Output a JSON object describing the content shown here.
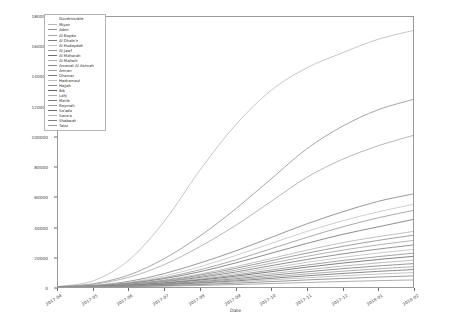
{
  "chart_data": {
    "type": "line",
    "title": "",
    "xlabel": "Date",
    "ylabel": "",
    "ylim": [
      0,
      180000
    ],
    "yticks": [
      0,
      20000,
      40000,
      60000,
      80000,
      100000,
      120000,
      140000,
      160000,
      180000
    ],
    "ytick_labels": [
      "0",
      "20000",
      "40000",
      "60000",
      "80000",
      "100000",
      "120000",
      "140000",
      "160000",
      "180000"
    ],
    "x": [
      "2017-04",
      "2017-05",
      "2017-06",
      "2017-07",
      "2017-08",
      "2017-09",
      "2017-10",
      "2017-11",
      "2017-12",
      "2018-01",
      "2018-02"
    ],
    "xtick_labels": [
      "2017-04",
      "2017-05",
      "2017-06",
      "2017-07",
      "2017-08",
      "2017-09",
      "2017-10",
      "2017-11",
      "2017-12",
      "2018-01",
      "2018-02"
    ],
    "grid": false,
    "legend_position": "upper left",
    "legend_title": "Governorate",
    "series": [
      {
        "name": "Miyan",
        "color": "#b7b7b7",
        "values": [
          300,
          4200,
          18000,
          44000,
          78000,
          108000,
          131000,
          146000,
          156000,
          165000,
          171000
        ]
      },
      {
        "name": "Aden",
        "color": "#8f8f8f",
        "values": [
          200,
          2200,
          8000,
          19000,
          34000,
          52000,
          72000,
          92000,
          107000,
          118000,
          125000
        ]
      },
      {
        "name": "Al Bayda",
        "color": "#a5a5a5",
        "values": [
          150,
          1800,
          6500,
          15000,
          27000,
          41000,
          57000,
          73000,
          85000,
          94000,
          101000
        ]
      },
      {
        "name": "Al Dhale'e",
        "color": "#7d7d7d",
        "values": [
          120,
          1100,
          3800,
          9000,
          16000,
          24000,
          33000,
          42000,
          50000,
          57000,
          62000
        ]
      },
      {
        "name": "Al Hudaydah",
        "color": "#c2c2c2",
        "values": [
          100,
          900,
          3100,
          7400,
          13500,
          21000,
          29000,
          37000,
          44000,
          50000,
          55000
        ]
      },
      {
        "name": "Al Jawf",
        "color": "#949494",
        "values": [
          90,
          800,
          2700,
          6300,
          11500,
          18000,
          25500,
          33000,
          40000,
          46000,
          51000
        ]
      },
      {
        "name": "Al Maharah",
        "color": "#6e6e6e",
        "values": [
          80,
          700,
          2400,
          5600,
          10200,
          16000,
          22500,
          29000,
          35000,
          40000,
          45000
        ]
      },
      {
        "name": "Al Mahwit",
        "color": "#b0b0b0",
        "values": [
          70,
          600,
          2000,
          4700,
          8600,
          13500,
          19000,
          24500,
          29500,
          33500,
          37000
        ]
      },
      {
        "name": "Amanat Al Asimah",
        "color": "#868686",
        "values": [
          65,
          550,
          1850,
          4300,
          7900,
          12400,
          17500,
          22500,
          27000,
          31000,
          34500
        ]
      },
      {
        "name": "Amran",
        "color": "#9d9d9d",
        "values": [
          60,
          500,
          1700,
          3900,
          7100,
          11200,
          15800,
          20400,
          24500,
          28000,
          31000
        ]
      },
      {
        "name": "Dhamar",
        "color": "#757575",
        "values": [
          55,
          450,
          1500,
          3500,
          6400,
          10000,
          14200,
          18300,
          22000,
          25200,
          28000
        ]
      },
      {
        "name": "Hadramaut",
        "color": "#bcbcbc",
        "values": [
          50,
          400,
          1350,
          3100,
          5700,
          9000,
          12700,
          16400,
          19700,
          22600,
          25000
        ]
      },
      {
        "name": "Hajjah",
        "color": "#8a8a8a",
        "values": [
          45,
          360,
          1200,
          2800,
          5100,
          8000,
          11300,
          14600,
          17600,
          20200,
          22500
        ]
      },
      {
        "name": "Ibb",
        "color": "#5f5f5f",
        "values": [
          40,
          320,
          1080,
          2500,
          4600,
          7200,
          10200,
          13200,
          15900,
          18300,
          20400
        ]
      },
      {
        "name": "Lahj",
        "color": "#a9a9a9",
        "values": [
          35,
          280,
          950,
          2200,
          4000,
          6300,
          8900,
          11500,
          13900,
          16000,
          17800
        ]
      },
      {
        "name": "Marib",
        "color": "#7a7a7a",
        "values": [
          30,
          240,
          820,
          1900,
          3500,
          5500,
          7800,
          10100,
          12200,
          14000,
          15600
        ]
      },
      {
        "name": "Raymah",
        "color": "#9a9a9a",
        "values": [
          28,
          210,
          710,
          1650,
          3000,
          4750,
          6700,
          8700,
          10500,
          12100,
          13500
        ]
      },
      {
        "name": "Sa'ada",
        "color": "#6a6a6a",
        "values": [
          25,
          180,
          610,
          1400,
          2600,
          4050,
          5750,
          7450,
          9000,
          10400,
          11600
        ]
      },
      {
        "name": "Sana'a",
        "color": "#b4b4b4",
        "values": [
          20,
          150,
          500,
          1160,
          2120,
          3350,
          4750,
          6150,
          7450,
          8600,
          9600
        ]
      },
      {
        "name": "Shabwah",
        "color": "#808080",
        "values": [
          15,
          110,
          380,
          880,
          1620,
          2550,
          3600,
          4700,
          5700,
          6600,
          7400
        ]
      },
      {
        "name": "Taizz",
        "color": "#989898",
        "values": [
          10,
          70,
          240,
          560,
          1030,
          1620,
          2300,
          3000,
          3650,
          4200,
          4700
        ]
      }
    ]
  }
}
